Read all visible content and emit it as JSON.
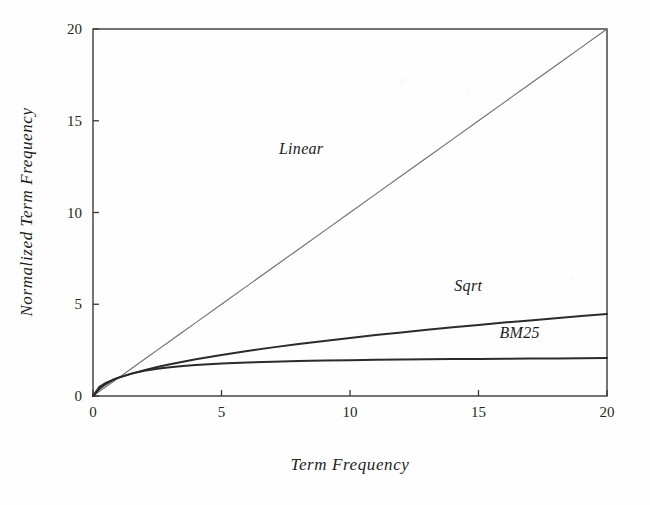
{
  "chart_data": {
    "type": "line",
    "title": "",
    "xlabel": "Term Frequency",
    "ylabel": "Normalized Term Frequency",
    "xlim": [
      0,
      20
    ],
    "ylim": [
      0,
      20
    ],
    "xticks": [
      0,
      5,
      10,
      15,
      20
    ],
    "yticks": [
      0,
      5,
      10,
      15,
      20
    ],
    "xticklabels": [
      "0",
      "5",
      "10",
      "15",
      "20"
    ],
    "yticklabels": [
      "0",
      "5",
      "10",
      "15",
      "20"
    ],
    "grid": false,
    "legend_position": "inline-annotations",
    "x": [
      0,
      0.25,
      0.5,
      0.75,
      1,
      1.5,
      2,
      2.5,
      3,
      3.5,
      4,
      5,
      6,
      7,
      8,
      9,
      10,
      11,
      12,
      13,
      14,
      15,
      16,
      17,
      18,
      19,
      20
    ],
    "series": [
      {
        "name": "Linear",
        "label": "Linear",
        "color": "#6e6e6e",
        "width": 1.1,
        "annotation": {
          "text": "Linear",
          "x": 8.1,
          "y": 13.2
        },
        "values": [
          0,
          0.25,
          0.5,
          0.75,
          1,
          1.5,
          2,
          2.5,
          3,
          3.5,
          4,
          5,
          6,
          7,
          8,
          9,
          10,
          11,
          12,
          13,
          14,
          15,
          16,
          17,
          18,
          19,
          20
        ]
      },
      {
        "name": "Sqrt",
        "label": "Sqrt",
        "color": "#2b2b2b",
        "width": 2.0,
        "annotation": {
          "text": "Sqrt",
          "x": 14.6,
          "y": 5.7
        },
        "values": [
          0,
          0.5,
          0.71,
          0.87,
          1,
          1.22,
          1.41,
          1.58,
          1.73,
          1.87,
          2,
          2.24,
          2.45,
          2.65,
          2.83,
          3,
          3.16,
          3.32,
          3.46,
          3.61,
          3.74,
          3.87,
          4,
          4.12,
          4.24,
          4.36,
          4.47
        ]
      },
      {
        "name": "BM25",
        "label": "BM25",
        "color": "#2b2b2b",
        "width": 2.0,
        "annotation": {
          "text": "BM25",
          "x": 16.6,
          "y": 3.15
        },
        "values": [
          0,
          0.38,
          0.65,
          0.85,
          1.0,
          1.22,
          1.38,
          1.49,
          1.57,
          1.64,
          1.69,
          1.77,
          1.83,
          1.87,
          1.91,
          1.93,
          1.95,
          1.97,
          1.99,
          2.0,
          2.01,
          2.02,
          2.03,
          2.04,
          2.05,
          2.06,
          2.07
        ]
      }
    ],
    "axes": {
      "frame_color": "#3a3a3a",
      "frame_width": 1.4,
      "tick_direction": "in",
      "tick_length": 6
    }
  }
}
